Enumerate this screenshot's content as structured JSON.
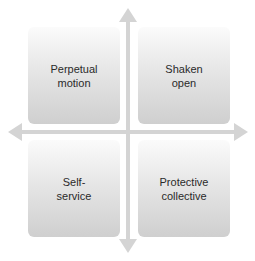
{
  "diagram": {
    "type": "2x2 quadrant matrix",
    "quadrants": {
      "top_left": "Perpetual motion",
      "top_right": "Shaken open",
      "bottom_left": "Self-service",
      "bottom_right": "Protective collective"
    },
    "axes": {
      "horizontal": "double-headed arrow",
      "vertical": "double-headed arrow"
    },
    "colors": {
      "axis": "#d2d2d2",
      "box_top": "#fbfbfb",
      "box_bottom": "#cfcfcf",
      "text": "#2a2a2a"
    }
  }
}
